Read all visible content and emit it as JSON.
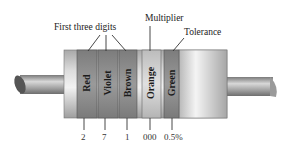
{
  "diagram": {
    "labels": {
      "first_three_digits": "First three digits",
      "multiplier": "Multiplier",
      "tolerance": "Tolerance"
    },
    "bands": [
      {
        "name": "Red",
        "value": "2",
        "role": "digit"
      },
      {
        "name": "Violet",
        "value": "7",
        "role": "digit"
      },
      {
        "name": "Brown",
        "value": "1",
        "role": "digit"
      },
      {
        "name": "Orange",
        "value": "000",
        "role": "multiplier"
      },
      {
        "name": "Green",
        "value": "0.5%",
        "role": "tolerance"
      }
    ],
    "colors": {
      "body_light": "#e6e6e6",
      "body_mid": "#c4c4c4",
      "body_dark": "#9a9a9a",
      "band_dark": "#8e8e8e",
      "band_light": "#d2d2d2",
      "lead": "#a8a8a8",
      "line": "#333333"
    }
  }
}
